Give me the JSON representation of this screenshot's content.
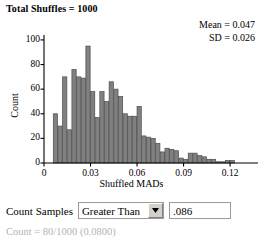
{
  "title": "Total Shuffles = 1000",
  "stats": {
    "mean": "Mean = 0.047",
    "sd": "SD = 0.026"
  },
  "controls": {
    "count_samples_label": "Count Samples",
    "comparison_selected": "Greater Than",
    "comparison_options": [
      "Greater Than",
      "Less Than",
      "Between",
      "Beyond"
    ],
    "threshold_value": ".086",
    "threshold_placeholder": "",
    "dropdown_icon": "chevron-down-icon"
  },
  "result_text": "Count = 80/1000 (0.0800)",
  "colors": {
    "bar_fill": "#808080",
    "bar_stroke": "#4d4d4d",
    "axis": "#000000",
    "result_text": "#b3b3b3"
  },
  "chart_data": {
    "type": "bar",
    "title": "Total Shuffles = 1000",
    "xlabel": "Shuffled MADs",
    "ylabel": "Count",
    "xlim": [
      0.0,
      0.138
    ],
    "ylim": [
      0,
      104
    ],
    "xticks": [
      0,
      0.03,
      0.06,
      0.09,
      0.12
    ],
    "xtick_labels": [
      "0",
      "0.03",
      "0.06",
      "0.09",
      "0.12"
    ],
    "yticks": [
      0,
      20,
      40,
      60,
      80,
      100
    ],
    "ytick_labels": [
      "0",
      "20",
      "40",
      "60",
      "80",
      "100"
    ],
    "grid": false,
    "legend": false,
    "bin_width": 0.003,
    "bin_starts": [
      0.006,
      0.009,
      0.012,
      0.015,
      0.018,
      0.021,
      0.024,
      0.027,
      0.03,
      0.033,
      0.036,
      0.039,
      0.042,
      0.045,
      0.048,
      0.051,
      0.054,
      0.057,
      0.06,
      0.063,
      0.066,
      0.069,
      0.072,
      0.075,
      0.078,
      0.081,
      0.084,
      0.087,
      0.09,
      0.093,
      0.096,
      0.099,
      0.102,
      0.105,
      0.108,
      0.111,
      0.114,
      0.117,
      0.12,
      0.126,
      0.129,
      0.132
    ],
    "values": [
      40,
      30,
      70,
      27,
      76,
      70,
      69,
      95,
      58,
      37,
      58,
      50,
      66,
      60,
      54,
      40,
      38,
      38,
      46,
      22,
      21,
      20,
      16,
      9,
      12,
      11,
      10,
      4,
      3,
      8,
      8,
      6,
      5,
      3,
      3,
      1,
      1,
      2,
      2
    ],
    "annotations": [
      "Mean = 0.047",
      "SD = 0.026",
      "Count = 80/1000 (0.0800)"
    ]
  }
}
